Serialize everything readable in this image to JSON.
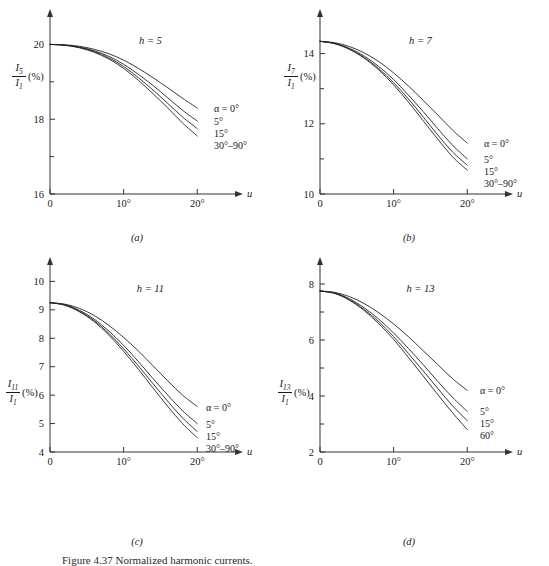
{
  "figure": {
    "caption": "Figure 4.37  Normalized harmonic currents."
  },
  "panels": [
    {
      "key": "a",
      "letter": "(a)",
      "note": "h = 5",
      "harmonic": 5,
      "y_axis": {
        "numerator": "I",
        "numerator_sub": "5",
        "denominator": "I",
        "denominator_sub": "1",
        "unit": "(%)",
        "labels": [
          "20",
          "18",
          "16"
        ]
      },
      "x_axis": {
        "title": "u",
        "labels": [
          "0",
          "10°",
          "20°"
        ]
      },
      "series_labels": [
        "α = 0°",
        "5°",
        "15°",
        "30°–90°"
      ]
    },
    {
      "key": "b",
      "letter": "(b)",
      "note": "h = 7",
      "harmonic": 7,
      "y_axis": {
        "numerator": "I",
        "numerator_sub": "7",
        "denominator": "I",
        "denominator_sub": "1",
        "unit": "(%)",
        "labels": [
          "14",
          "12",
          "10"
        ]
      },
      "x_axis": {
        "title": "u",
        "labels": [
          "0",
          "10°",
          "20°"
        ]
      },
      "series_labels": [
        "α = 0°",
        "5°",
        "15°",
        "30°–90°"
      ]
    },
    {
      "key": "c",
      "letter": "(c)",
      "note": "h = 11",
      "harmonic": 11,
      "y_axis": {
        "numerator": "I",
        "numerator_sub": "11",
        "denominator": "I",
        "denominator_sub": "1",
        "unit": "(%)",
        "labels": [
          "10",
          "9",
          "8",
          "7",
          "6",
          "5",
          "4"
        ]
      },
      "x_axis": {
        "title": "u",
        "labels": [
          "0",
          "10°",
          "20°"
        ]
      },
      "series_labels": [
        "α = 0°",
        "5°",
        "15°",
        "30°–90°"
      ]
    },
    {
      "key": "d",
      "letter": "(d)",
      "note": "h = 13",
      "harmonic": 13,
      "y_axis": {
        "numerator": "I",
        "numerator_sub": "13",
        "denominator": "I",
        "denominator_sub": "1",
        "unit": "(%)",
        "labels": [
          "8",
          "6",
          "4",
          "2"
        ]
      },
      "x_axis": {
        "title": "u",
        "labels": [
          "0",
          "10°",
          "20°"
        ]
      },
      "series_labels": [
        "α = 0°",
        "5°",
        "15°",
        "60°"
      ]
    }
  ],
  "chart_data": [
    {
      "type": "line",
      "title": "h = 5",
      "panel": "(a)",
      "xlabel": "u",
      "ylabel": "I5/I1 (%)",
      "xlim": [
        0,
        22
      ],
      "ylim": [
        16,
        20.6
      ],
      "xticks": [
        0,
        10,
        20
      ],
      "xticklabels": [
        "0",
        "10°",
        "20°"
      ],
      "yticks": [
        16,
        17,
        18,
        19,
        20
      ],
      "yticklabels": [
        "16",
        "",
        "18",
        "",
        "20"
      ],
      "grid": false,
      "legend": "inline-right-end",
      "x": [
        0,
        2,
        4,
        6,
        8,
        10,
        12,
        14,
        16,
        18,
        20
      ],
      "series": [
        {
          "name": "α = 0°",
          "values": [
            20.0,
            19.99,
            19.95,
            19.87,
            19.75,
            19.58,
            19.36,
            19.11,
            18.84,
            18.56,
            18.3
          ]
        },
        {
          "name": "5°",
          "values": [
            20.0,
            19.98,
            19.93,
            19.83,
            19.68,
            19.47,
            19.2,
            18.9,
            18.57,
            18.24,
            17.95
          ]
        },
        {
          "name": "15°",
          "values": [
            20.0,
            19.98,
            19.92,
            19.81,
            19.64,
            19.41,
            19.11,
            18.78,
            18.42,
            18.06,
            17.75
          ]
        },
        {
          "name": "30°–90°",
          "values": [
            20.0,
            19.98,
            19.91,
            19.79,
            19.61,
            19.36,
            19.04,
            18.68,
            18.3,
            17.9,
            17.55
          ]
        }
      ]
    },
    {
      "type": "line",
      "title": "h = 7",
      "panel": "(b)",
      "xlabel": "u",
      "ylabel": "I7/I1 (%)",
      "xlim": [
        0,
        22
      ],
      "ylim": [
        10,
        14.9
      ],
      "xticks": [
        0,
        10,
        20
      ],
      "xticklabels": [
        "0",
        "10°",
        "20°"
      ],
      "yticks": [
        10,
        11,
        12,
        13,
        14
      ],
      "yticklabels": [
        "10",
        "",
        "12",
        "",
        "14"
      ],
      "grid": false,
      "legend": "inline-right-end",
      "x": [
        0,
        2,
        4,
        6,
        8,
        10,
        12,
        14,
        16,
        18,
        20
      ],
      "series": [
        {
          "name": "α = 0°",
          "values": [
            14.35,
            14.31,
            14.2,
            14.02,
            13.77,
            13.45,
            13.08,
            12.67,
            12.25,
            11.82,
            11.45
          ]
        },
        {
          "name": "5°",
          "values": [
            14.35,
            14.29,
            14.15,
            13.93,
            13.63,
            13.26,
            12.82,
            12.35,
            11.86,
            11.39,
            11.0
          ]
        },
        {
          "name": "15°",
          "values": [
            14.35,
            14.29,
            14.13,
            13.89,
            13.57,
            13.17,
            12.71,
            12.2,
            11.68,
            11.2,
            10.82
          ]
        },
        {
          "name": "30°–90°",
          "values": [
            14.35,
            14.28,
            14.12,
            13.87,
            13.53,
            13.11,
            12.62,
            12.09,
            11.56,
            11.06,
            10.68
          ]
        }
      ]
    },
    {
      "type": "line",
      "title": "h = 11",
      "panel": "(c)",
      "xlabel": "u",
      "ylabel": "I11/I1 (%)",
      "xlim": [
        0,
        22
      ],
      "ylim": [
        4,
        10.4
      ],
      "xticks": [
        0,
        10,
        20
      ],
      "xticklabels": [
        "0",
        "10°",
        "20°"
      ],
      "yticks": [
        4,
        5,
        6,
        7,
        8,
        9,
        10
      ],
      "yticklabels": [
        "4",
        "5",
        "6",
        "7",
        "8",
        "9",
        "10"
      ],
      "grid": false,
      "legend": "inline-right-end",
      "x": [
        0,
        2,
        4,
        6,
        8,
        10,
        12,
        14,
        16,
        18,
        20
      ],
      "series": [
        {
          "name": "α = 0°",
          "values": [
            9.25,
            9.2,
            9.05,
            8.8,
            8.45,
            8.03,
            7.55,
            7.03,
            6.5,
            6.0,
            5.6
          ]
        },
        {
          "name": "5°",
          "values": [
            9.25,
            9.18,
            8.98,
            8.67,
            8.25,
            7.75,
            7.18,
            6.58,
            6.0,
            5.45,
            5.0
          ]
        },
        {
          "name": "15°",
          "values": [
            9.25,
            9.17,
            8.95,
            8.62,
            8.17,
            7.63,
            7.03,
            6.4,
            5.78,
            5.2,
            4.72
          ]
        },
        {
          "name": "30°–90°",
          "values": [
            9.25,
            9.16,
            8.93,
            8.58,
            8.11,
            7.54,
            6.91,
            6.25,
            5.6,
            5.0,
            4.5
          ]
        }
      ]
    },
    {
      "type": "line",
      "title": "h = 13",
      "panel": "(d)",
      "xlabel": "u",
      "ylabel": "I13/I1 (%)",
      "xlim": [
        0,
        22
      ],
      "ylim": [
        2,
        8.5
      ],
      "xticks": [
        0,
        10,
        20
      ],
      "xticklabels": [
        "0",
        "10°",
        "20°"
      ],
      "yticks": [
        2,
        3,
        4,
        5,
        6,
        7,
        8
      ],
      "yticklabels": [
        "2",
        "",
        "4",
        "",
        "6",
        "",
        "8"
      ],
      "grid": false,
      "legend": "inline-right-end",
      "x": [
        0,
        2,
        4,
        6,
        8,
        10,
        12,
        14,
        16,
        18,
        20
      ],
      "series": [
        {
          "name": "α = 0°",
          "values": [
            7.75,
            7.7,
            7.55,
            7.3,
            6.97,
            6.57,
            6.12,
            5.62,
            5.12,
            4.62,
            4.2
          ]
        },
        {
          "name": "5°",
          "values": [
            7.75,
            7.68,
            7.47,
            7.15,
            6.74,
            6.25,
            5.7,
            5.12,
            4.52,
            3.95,
            3.45
          ]
        },
        {
          "name": "15°",
          "values": [
            7.75,
            7.67,
            7.44,
            7.09,
            6.65,
            6.12,
            5.52,
            4.9,
            4.27,
            3.65,
            3.12
          ]
        },
        {
          "name": "60°",
          "values": [
            7.75,
            7.66,
            7.42,
            7.05,
            6.58,
            6.02,
            5.38,
            4.72,
            4.05,
            3.4,
            2.8
          ]
        }
      ]
    }
  ]
}
